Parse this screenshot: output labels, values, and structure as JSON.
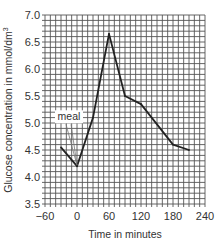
{
  "chart_data": {
    "type": "line",
    "title": "",
    "xlabel": "Time in minutes",
    "ylabel": "Glucose concentration in mmol/dm",
    "ylabel_superscript": "3",
    "xlim": [
      -60,
      240
    ],
    "ylim": [
      3.5,
      7.0
    ],
    "x_ticks": [
      -60,
      0,
      60,
      120,
      180,
      240
    ],
    "x_tick_labels": [
      "−60",
      "0",
      "60",
      "120",
      "180",
      "240"
    ],
    "y_ticks": [
      3.5,
      4.0,
      4.5,
      5.0,
      5.5,
      6.0,
      6.5,
      7.0
    ],
    "y_tick_labels": [
      "3.5",
      "4.0",
      "4.5",
      "5.0",
      "5.5",
      "6.0",
      "6.5",
      "7.0"
    ],
    "grid": true,
    "grid_minor_x_step": 10,
    "grid_minor_y_step": 0.1,
    "series": [
      {
        "name": "Glucose concentration",
        "x": [
          -30,
          0,
          30,
          60,
          90,
          120,
          180,
          210
        ],
        "y": [
          4.55,
          4.2,
          5.1,
          6.65,
          5.5,
          5.35,
          4.6,
          4.5
        ],
        "color": "#222222"
      }
    ],
    "annotations": [
      {
        "text": "meal",
        "x": -15,
        "y": 5.05,
        "arrow_to": {
          "x": 0,
          "y": 4.2
        }
      }
    ],
    "legend": "none"
  }
}
